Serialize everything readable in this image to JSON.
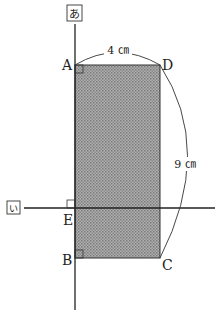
{
  "diagram": {
    "axes": {
      "vertical_label": "あ",
      "horizontal_label": "い"
    },
    "points": {
      "A": "A",
      "B": "B",
      "C": "C",
      "D": "D",
      "E": "E"
    },
    "dimensions": {
      "width": "4 ㎝",
      "diagonal": "9 ㎝"
    },
    "colors": {
      "fill": "#9a9a9a",
      "stroke": "#222222"
    }
  }
}
